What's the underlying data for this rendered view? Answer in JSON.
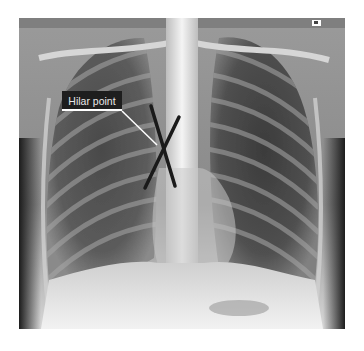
{
  "image": {
    "type": "chest-xray-pa",
    "annotation": {
      "label": "Hilar point",
      "marker": "X"
    },
    "colors": {
      "label_bg": "#1e1e1e",
      "label_text": "#e8e8e8",
      "leader_line": "#ffffff",
      "marker_line": "#1a1a1a"
    }
  }
}
